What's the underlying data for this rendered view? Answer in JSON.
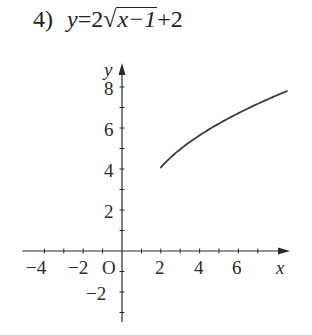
{
  "problem": {
    "number": "4)",
    "lhs": "y",
    "equals": "=",
    "coef": "2",
    "radical_symbol": "√",
    "radicand": "x−1",
    "tail": "+2"
  },
  "axes": {
    "x_label": "x",
    "y_label": "y",
    "origin_label": "O",
    "x_tick_labels": [
      "−4",
      "−2",
      "2",
      "4",
      "6"
    ],
    "y_tick_labels": [
      "8",
      "6",
      "4",
      "2",
      "−2"
    ]
  },
  "chart_data": {
    "type": "line",
    "xlabel": "x",
    "ylabel": "y",
    "xlim": [
      -4,
      8.7
    ],
    "ylim": [
      -3.4,
      9.2
    ],
    "x_ticks": [
      -4,
      -3,
      -2,
      -1,
      0,
      1,
      2,
      3,
      4,
      5,
      6,
      7
    ],
    "y_ticks": [
      -3,
      -2,
      -1,
      1,
      2,
      3,
      4,
      5,
      6,
      7,
      8
    ],
    "x_tick_labels_shown": [
      -4,
      -2,
      2,
      4,
      6
    ],
    "y_tick_labels_shown": [
      8,
      6,
      4,
      2,
      -2
    ],
    "grid": false,
    "legend": null,
    "series": [
      {
        "name": "y=2√(x−1)+2",
        "domain_start": [
          2,
          3
        ],
        "x": [
          2,
          2.25,
          2.5,
          3,
          3.5,
          4,
          4.5,
          5,
          5.5,
          6,
          6.5,
          7,
          7.5,
          8,
          8.5
        ],
        "y": [
          3,
          3.24,
          3.45,
          3.83,
          4.16,
          4.46,
          4.74,
          5.0,
          5.24,
          5.47,
          5.69,
          5.9,
          6.1,
          6.29,
          6.48
        ]
      }
    ],
    "note": "Curve as drawn starts at (2,3) and rises concavely to the right edge near x≈8.4."
  },
  "style": {
    "ink": "#2a2a2a",
    "background": "#ffffff"
  }
}
